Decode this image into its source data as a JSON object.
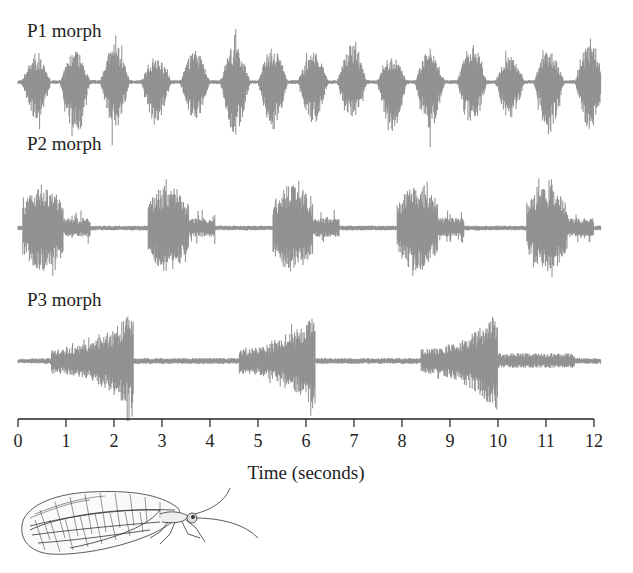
{
  "chart_data": {
    "type": "line",
    "title": "",
    "subtitle": "Waveforms (oscillograms) of courtship songs of three lacewing morphs",
    "xlabel": "Time (seconds)",
    "ylabel": "",
    "xlim": [
      0,
      12
    ],
    "x_ticks": [
      0,
      1,
      2,
      3,
      4,
      5,
      6,
      7,
      8,
      9,
      10,
      11,
      12
    ],
    "grid": false,
    "legend": "none",
    "waveform_color": "#8c8c8c",
    "series": [
      {
        "name": "P1 morph",
        "description": "Short, regularly repeated volleys",
        "burst_count": 15,
        "burst_center_times_s": [
          0.38,
          1.19,
          2.02,
          2.88,
          3.69,
          4.52,
          5.31,
          6.15,
          6.96,
          7.79,
          8.58,
          9.46,
          10.25,
          11.06,
          11.92
        ],
        "burst_duration_s": 0.5,
        "period_s": 0.82,
        "max_amplitude_rel": 1.0
      },
      {
        "name": "P2 morph",
        "description": "Longer volleys with loud onset and decaying tail",
        "burst_count": 5,
        "burst_start_times_s": [
          0.1,
          2.7,
          5.3,
          7.9,
          10.6
        ],
        "burst_loud_duration_s": 0.85,
        "burst_tail_duration_s": 1.4,
        "period_s": 2.6,
        "max_amplitude_rel": 1.0
      },
      {
        "name": "P3 morph",
        "description": "Long crescendo volleys, amplitude increasing to an abrupt end",
        "burst_count": 3,
        "burst_start_times_s": [
          0.7,
          4.6,
          8.4
        ],
        "burst_end_times_s": [
          2.4,
          6.2,
          10.0
        ],
        "period_s": 3.85,
        "max_amplitude_rel": 1.0
      }
    ]
  },
  "labels": {
    "p1": "P1 morph",
    "p2": "P2 morph",
    "p3": "P3 morph",
    "x_axis_title": "Time (seconds)"
  },
  "ticks": [
    "0",
    "1",
    "2",
    "3",
    "4",
    "5",
    "6",
    "7",
    "8",
    "9",
    "10",
    "11",
    "12"
  ],
  "illustration": {
    "subject": "green lacewing (Chrysoperla) line drawing"
  }
}
